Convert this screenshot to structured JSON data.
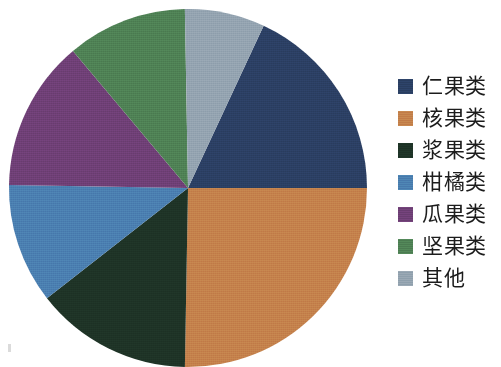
{
  "chart_data": {
    "type": "pie",
    "title": "",
    "subtitle": "",
    "xlabel": "",
    "ylabel": "",
    "legend_position": "right",
    "grid": false,
    "start_angle_deg": 0,
    "direction": "clockwise",
    "categories": [
      "仁果类",
      "核果类",
      "浆果类",
      "柑橘类",
      "瓜果类",
      "坚果类",
      "其他"
    ],
    "values": [
      18,
      25,
      14,
      16,
      13,
      7,
      7
    ],
    "colors": [
      "#2b3f63",
      "#c4804b",
      "#1e3326",
      "#4a7eb0",
      "#6e3f75",
      "#4e8054",
      "#93a3b0"
    ],
    "slices": [
      {
        "label": "仁果类",
        "value": 18,
        "percent": 18,
        "color": "#2b3f63",
        "start_deg": 25,
        "end_deg": 90
      },
      {
        "label": "核果类",
        "value": 25,
        "percent": 25,
        "color": "#c4804b",
        "start_deg": 90,
        "end_deg": 181
      },
      {
        "label": "浆果类",
        "value": 14,
        "percent": 14,
        "color": "#1e3326",
        "start_deg": 181,
        "end_deg": 232
      },
      {
        "label": "柑橘类",
        "value": 16,
        "percent": 16,
        "color": "#4a7eb0",
        "start_deg": 232,
        "end_deg": 271
      },
      {
        "label": "瓜果类",
        "value": 13,
        "percent": 13,
        "color": "#6e3f75",
        "start_deg": 271,
        "end_deg": 320
      },
      {
        "label": "坚果类",
        "value": 7,
        "percent": 7,
        "color": "#4e8054",
        "start_deg": 320,
        "end_deg": 359
      },
      {
        "label": "其他",
        "value": 7,
        "percent": 7,
        "color": "#93a3b0",
        "start_deg": 359,
        "end_deg": 25
      }
    ]
  },
  "legend": {
    "items": [
      {
        "label": "仁果类",
        "color": "#2b3f63"
      },
      {
        "label": "核果类",
        "color": "#c4804b"
      },
      {
        "label": "浆果类",
        "color": "#1e3326"
      },
      {
        "label": "柑橘类",
        "color": "#4a7eb0"
      },
      {
        "label": "瓜果类",
        "color": "#6e3f75"
      },
      {
        "label": "坚果类",
        "color": "#4e8054"
      },
      {
        "label": "其他",
        "color": "#93a3b0"
      }
    ]
  }
}
